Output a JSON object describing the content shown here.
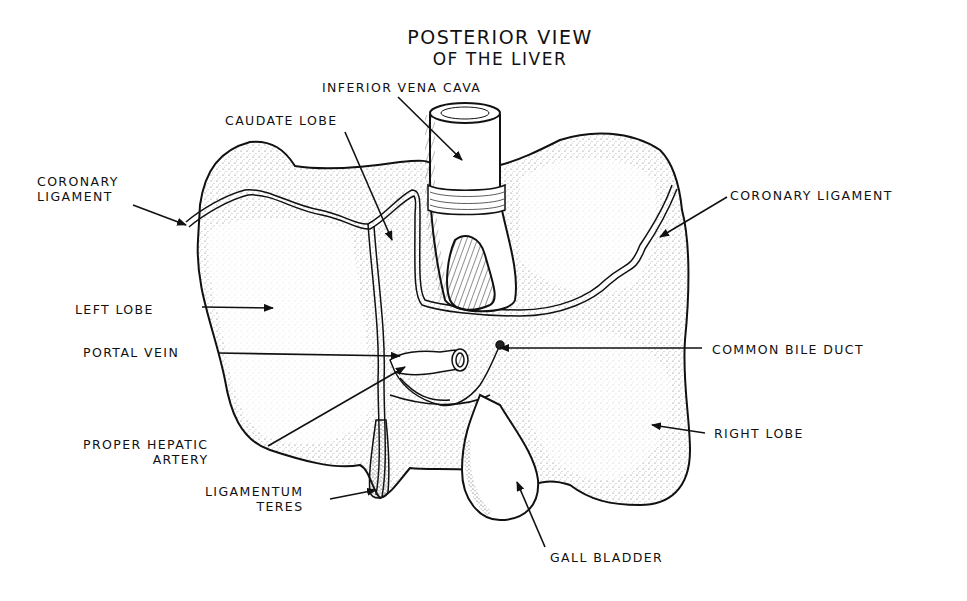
{
  "title": {
    "line1": "POSTERIOR VIEW",
    "line2": "OF THE LIVER"
  },
  "labels": [
    {
      "id": "inferior-vena-cava",
      "lines": [
        "INFERIOR VENA CAVA"
      ],
      "x": 322,
      "y": 80,
      "align": "left",
      "arrow": {
        "from": [
          398,
          97
        ],
        "to": [
          462,
          160
        ]
      }
    },
    {
      "id": "caudate-lobe",
      "lines": [
        "CAUDATE LOBE"
      ],
      "x": 225,
      "y": 113,
      "align": "left",
      "arrow": {
        "from": [
          345,
          132
        ],
        "to": [
          392,
          240
        ]
      }
    },
    {
      "id": "coronary-ligament-left",
      "lines": [
        "CORONARY",
        "LIGAMENT"
      ],
      "x": 37,
      "y": 174,
      "align": "left",
      "arrow": {
        "from": [
          133,
          205
        ],
        "to": [
          186,
          225
        ]
      }
    },
    {
      "id": "coronary-ligament-right",
      "lines": [
        "CORONARY LIGAMENT"
      ],
      "x": 730,
      "y": 188,
      "align": "left",
      "arrow": {
        "from": [
          727,
          197
        ],
        "to": [
          660,
          237
        ]
      }
    },
    {
      "id": "left-lobe",
      "lines": [
        "LEFT LOBE"
      ],
      "x": 75,
      "y": 302,
      "align": "left",
      "arrow": {
        "from": [
          202,
          307
        ],
        "to": [
          273,
          308
        ]
      }
    },
    {
      "id": "portal-vein",
      "lines": [
        "PORTAL VEIN"
      ],
      "x": 83,
      "y": 345,
      "align": "left",
      "arrow": {
        "from": [
          218,
          353
        ],
        "to": [
          400,
          356
        ]
      }
    },
    {
      "id": "common-bile-duct",
      "lines": [
        "COMMON BILE DUCT"
      ],
      "x": 712,
      "y": 342,
      "align": "left",
      "arrow": {
        "from": [
          702,
          348
        ],
        "to": [
          500,
          348
        ]
      }
    },
    {
      "id": "proper-hepatic-artery",
      "lines": [
        "PROPER HEPATIC",
        "ARTERY"
      ],
      "x": 83,
      "y": 437,
      "align": "right",
      "arrow": {
        "from": [
          268,
          446
        ],
        "to": [
          405,
          367
        ]
      }
    },
    {
      "id": "right-lobe",
      "lines": [
        "RIGHT LOBE"
      ],
      "x": 714,
      "y": 426,
      "align": "left",
      "arrow": {
        "from": [
          705,
          433
        ],
        "to": [
          652,
          425
        ]
      }
    },
    {
      "id": "ligamentum-teres",
      "lines": [
        "LIGAMENTUM",
        "TERES"
      ],
      "x": 205,
      "y": 484,
      "align": "right",
      "arrow": {
        "from": [
          330,
          499
        ],
        "to": [
          376,
          490
        ]
      }
    },
    {
      "id": "gall-bladder",
      "lines": [
        "GALL BLADDER"
      ],
      "x": 550,
      "y": 550,
      "align": "left",
      "arrow": {
        "from": [
          545,
          547
        ],
        "to": [
          517,
          482
        ]
      }
    }
  ],
  "colors": {
    "ink": "#111111",
    "paper": "#ffffff",
    "stipple": "#555555"
  }
}
